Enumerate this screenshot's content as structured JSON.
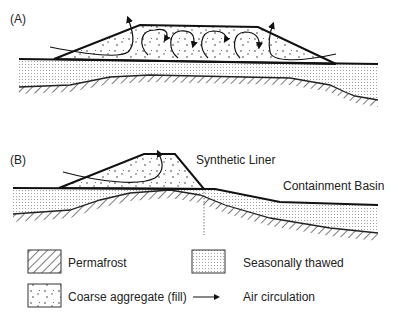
{
  "panels": {
    "a": {
      "label": "(A)"
    },
    "b": {
      "label": "(B)",
      "liner_label": "Synthetic Liner",
      "basin_label": "Containment Basin"
    }
  },
  "legend": {
    "items": [
      {
        "key": "permafrost",
        "label": "Permafrost",
        "icon": "hatch-pattern-icon"
      },
      {
        "key": "seasonally_thawed",
        "label": "Seasonally thawed",
        "icon": "dot-stipple-icon"
      },
      {
        "key": "coarse_aggregate",
        "label": "Coarse aggregate (fill)",
        "icon": "speckle-fill-icon"
      },
      {
        "key": "air_circulation",
        "label": "Air circulation",
        "icon": "arrow-right-icon"
      }
    ]
  },
  "colors": {
    "line": "#1a1a1a",
    "stipple": "#9a9a9a",
    "background": "#ffffff"
  }
}
